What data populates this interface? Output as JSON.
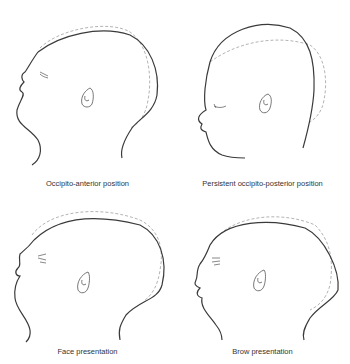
{
  "figure": {
    "panels": [
      {
        "id": "occipito-anterior",
        "caption": "Occipito-anterior position"
      },
      {
        "id": "persistent-occipito-posterior",
        "caption": "Persistent occipito-posterior position"
      },
      {
        "id": "face-presentation",
        "caption": "Face presentation"
      },
      {
        "id": "brow-presentation",
        "caption": "Brow presentation"
      }
    ],
    "colors": {
      "outline": "#3a3a3a",
      "dashed_reference": "#aaaaaa",
      "caption_text": "#333333"
    },
    "cutoff_caption": "· · · · · · · · · · · · · · · · · · · · · · · · · · ·"
  }
}
